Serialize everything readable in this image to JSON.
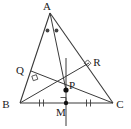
{
  "figure": {
    "background_color": "#ffffff",
    "stroke_color": "#3a3a3a",
    "label_color": "#1a1a1a",
    "point_fill": "#111111",
    "labels": {
      "A": "A",
      "B": "B",
      "C": "C",
      "P": "P",
      "Q": "Q",
      "R": "R",
      "M": "M"
    },
    "points": {
      "A": {
        "x": 50,
        "y": 13
      },
      "B": {
        "x": 20,
        "y": 103
      },
      "C": {
        "x": 113,
        "y": 103
      },
      "M": {
        "x": 66,
        "y": 103
      },
      "P": {
        "x": 66,
        "y": 90
      },
      "Q": {
        "x": 31,
        "y": 71
      },
      "R": {
        "x": 89,
        "y": 63
      }
    },
    "label_positions": {
      "A": {
        "x": 47,
        "y": 10
      },
      "B": {
        "x": 6,
        "y": 108
      },
      "C": {
        "x": 118,
        "y": 108
      },
      "P": {
        "x": 69,
        "y": 87
      },
      "Q": {
        "x": 20,
        "y": 70
      },
      "R": {
        "x": 96,
        "y": 63
      },
      "M": {
        "x": 61,
        "y": 115
      }
    },
    "segments": [
      {
        "name": "side-AB",
        "from": "A",
        "to": "B"
      },
      {
        "name": "side-AC",
        "from": "A",
        "to": "C"
      },
      {
        "name": "side-BC",
        "from": "B",
        "to": "C"
      },
      {
        "name": "cevian-AP",
        "from": "A",
        "to": "P"
      },
      {
        "name": "cevian-BR",
        "from": "B",
        "to": "R"
      },
      {
        "name": "cevian-CQ",
        "from": "C",
        "to": "Q"
      },
      {
        "name": "perpendicular-line-M",
        "from": "M-top",
        "to": "M-bottom"
      }
    ],
    "marks": {
      "angle_bisector_dots": 2,
      "right_angles": [
        "Q",
        "R",
        "M"
      ],
      "congruent_tick_segments": [
        "BM",
        "MC"
      ],
      "ticks_per_segment": 2
    },
    "marked_points": [
      "P",
      "M"
    ]
  }
}
